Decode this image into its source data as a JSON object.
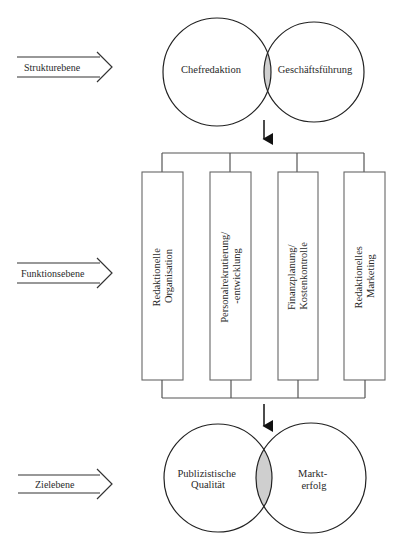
{
  "levels": [
    {
      "label": "Strukturebene"
    },
    {
      "label": "Funktionsebene"
    },
    {
      "label": "Zielebene"
    }
  ],
  "structure": {
    "left": "Chefredaktion",
    "right": "Geschäftsführung"
  },
  "functions": [
    {
      "lines": [
        "Redaktionelle",
        "Organisation"
      ]
    },
    {
      "lines": [
        "Personalrekrutierung/",
        "-entwicklung"
      ]
    },
    {
      "lines": [
        "Finanzplanung/",
        "Kostenkontrolle"
      ]
    },
    {
      "lines": [
        "Redaktionelles",
        "Marketing"
      ]
    }
  ],
  "goals": {
    "left": [
      "Publizistische",
      "Qualität"
    ],
    "right": [
      "Markt-",
      "erfolg"
    ]
  },
  "colors": {
    "overlap": "#cfcfcf",
    "stroke": "#222222",
    "box_stroke": "#666666"
  }
}
